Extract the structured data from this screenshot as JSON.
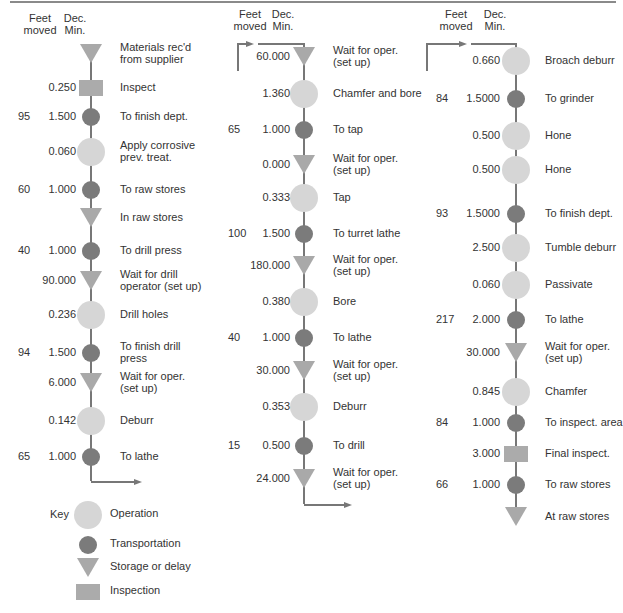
{
  "headers": {
    "feet": [
      "Feet",
      "moved"
    ],
    "min": [
      "Dec.",
      "Min."
    ]
  },
  "colors": {
    "operation": "#d6d6d6",
    "transportation": "#7b7b7b",
    "storage": "#a9a9a9",
    "inspection": "#ababab",
    "line": "#777777"
  },
  "columns": [
    {
      "steps": [
        {
          "type": "storage",
          "feet": "",
          "min": "",
          "label": "Materials rec'd\nfrom supplier"
        },
        {
          "type": "inspection",
          "feet": "",
          "min": "0.250",
          "label": "Inspect"
        },
        {
          "type": "transportation",
          "feet": "95",
          "min": "1.500",
          "label": "To finish dept."
        },
        {
          "type": "operation",
          "feet": "",
          "min": "0.060",
          "label": "Apply corrosive\nprev. treat."
        },
        {
          "type": "transportation",
          "feet": "60",
          "min": "1.000",
          "label": "To raw stores"
        },
        {
          "type": "storage",
          "feet": "",
          "min": "",
          "label": "In raw stores"
        },
        {
          "type": "transportation",
          "feet": "40",
          "min": "1.000",
          "label": "To drill press"
        },
        {
          "type": "storage",
          "feet": "",
          "min": "90.000",
          "label": "Wait for drill\noperator (set up)"
        },
        {
          "type": "operation",
          "feet": "",
          "min": "0.236",
          "label": "Drill holes"
        },
        {
          "type": "transportation",
          "feet": "94",
          "min": "1.500",
          "label": "To finish drill\npress"
        },
        {
          "type": "storage",
          "feet": "",
          "min": "6.000",
          "label": "Wait for oper.\n(set up)"
        },
        {
          "type": "operation",
          "feet": "",
          "min": "0.142",
          "label": "Deburr"
        },
        {
          "type": "transportation",
          "feet": "65",
          "min": "1.000",
          "label": "To lathe"
        }
      ]
    },
    {
      "steps": [
        {
          "type": "storage",
          "feet": "",
          "min": "60.000",
          "label": "Wait for oper.\n(set up)"
        },
        {
          "type": "operation",
          "feet": "",
          "min": "1.360",
          "label": "Chamfer and bore"
        },
        {
          "type": "transportation",
          "feet": "65",
          "min": "1.000",
          "label": "To tap"
        },
        {
          "type": "storage",
          "feet": "",
          "min": "0.000",
          "label": "Wait for oper.\n(set up)"
        },
        {
          "type": "operation",
          "feet": "",
          "min": "0.333",
          "label": "Tap"
        },
        {
          "type": "transportation",
          "feet": "100",
          "min": "1.500",
          "label": "To turret lathe"
        },
        {
          "type": "storage",
          "feet": "",
          "min": "180.000",
          "label": "Wait for oper.\n(set up)"
        },
        {
          "type": "operation",
          "feet": "",
          "min": "0.380",
          "label": "Bore"
        },
        {
          "type": "transportation",
          "feet": "40",
          "min": "1.000",
          "label": "To lathe"
        },
        {
          "type": "storage",
          "feet": "",
          "min": "30.000",
          "label": "Wait for oper.\n(set up)"
        },
        {
          "type": "operation",
          "feet": "",
          "min": "0.353",
          "label": "Deburr"
        },
        {
          "type": "transportation",
          "feet": "15",
          "min": "0.500",
          "label": "To drill"
        },
        {
          "type": "storage",
          "feet": "",
          "min": "24.000",
          "label": "Wait for oper.\n(set up)"
        }
      ]
    },
    {
      "steps": [
        {
          "type": "operation",
          "feet": "",
          "min": "0.660",
          "label": "Broach deburr"
        },
        {
          "type": "transportation",
          "feet": "84",
          "min": "1.5000",
          "label": "To grinder"
        },
        {
          "type": "operation",
          "feet": "",
          "min": "0.500",
          "label": "Hone"
        },
        {
          "type": "operation",
          "feet": "",
          "min": "0.500",
          "label": "Hone"
        },
        {
          "type": "transportation",
          "feet": "93",
          "min": "1.5000",
          "label": "To finish dept."
        },
        {
          "type": "operation",
          "feet": "",
          "min": "2.500",
          "label": "Tumble deburr"
        },
        {
          "type": "operation",
          "feet": "",
          "min": "0.060",
          "label": "Passivate"
        },
        {
          "type": "transportation",
          "feet": "217",
          "min": "2.000",
          "label": "To lathe"
        },
        {
          "type": "storage",
          "feet": "",
          "min": "30.000",
          "label": "Wait for oper.\n(set up)"
        },
        {
          "type": "operation",
          "feet": "",
          "min": "0.845",
          "label": "Chamfer"
        },
        {
          "type": "transportation",
          "feet": "84",
          "min": "1.000",
          "label": "To inspect. area"
        },
        {
          "type": "inspection",
          "feet": "",
          "min": "3.000",
          "label": "Final inspect."
        },
        {
          "type": "transportation",
          "feet": "66",
          "min": "1.000",
          "label": "To raw stores"
        },
        {
          "type": "storage",
          "feet": "",
          "min": "",
          "label": "At raw stores"
        }
      ]
    }
  ],
  "legend": {
    "title": "Key",
    "items": [
      {
        "type": "operation",
        "label": "Operation"
      },
      {
        "type": "transportation",
        "label": "Transportation"
      },
      {
        "type": "storage",
        "label": "Storage or delay"
      },
      {
        "type": "inspection",
        "label": "Inspection"
      }
    ]
  }
}
